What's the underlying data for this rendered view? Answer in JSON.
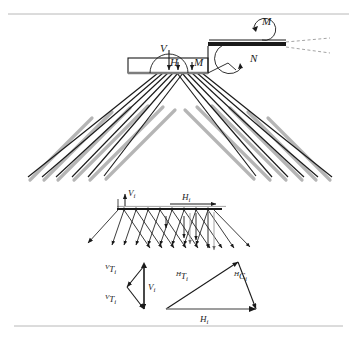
{
  "figure": {
    "caption_top": "",
    "rules": {
      "top_y": 14,
      "bottom_y": 326,
      "color": "#b8b8b8"
    }
  },
  "main_diagram": {
    "name": "cable-stay-force-diagram",
    "labels": {
      "vertical_force": "V",
      "horizontal_force": "H",
      "moment_deck": "M",
      "moment_pylon": "M",
      "normal_force": "N"
    },
    "colors": {
      "line": "#1a1a1a",
      "shadow": "#b5b5b5",
      "deck_fill": "#ffffff"
    }
  },
  "middle_diagram": {
    "name": "incremental-force-diagram",
    "labels": {
      "vertical_increment": "V",
      "vertical_increment_sub": "i",
      "horizontal_increment": "H",
      "horizontal_increment_sub": "i"
    }
  },
  "bottom_diagram": {
    "name": "force-triangle-diagram",
    "left_triangle": {
      "top_label_sup": "V",
      "top_label_main": "T",
      "top_label_sub": "i",
      "bottom_label_sup": "V",
      "bottom_label_main": "T",
      "bottom_label_sub": "i",
      "vertical_label_main": "V",
      "vertical_label_sub": "i"
    },
    "right_triangle": {
      "left_label_sup": "H",
      "left_label_main": "T",
      "left_label_sub": "i",
      "right_label_sup": "H",
      "right_label_main": "C",
      "right_label_sub": "i",
      "base_label_main": "H",
      "base_label_sub": "i"
    }
  }
}
